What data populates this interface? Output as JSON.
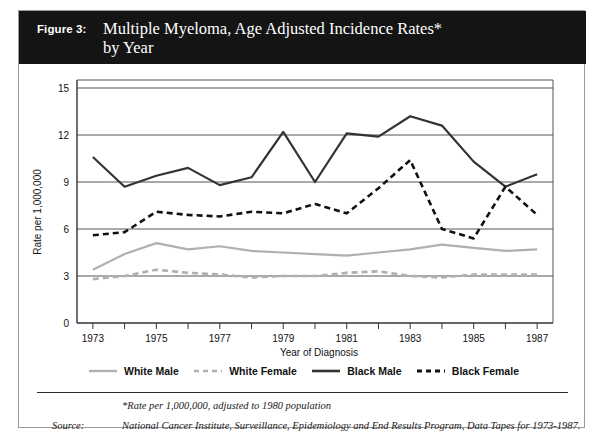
{
  "figure": {
    "label": "Figure 3:",
    "title": "Multiple Myeloma, Age Adjusted Incidence Rates*\nby Year"
  },
  "footnotes": {
    "star_note": "*Rate per 1,000,000, adjusted to 1980 population",
    "source_label": "Source:",
    "source_text": "National Cancer Institute, Surveillance, Epidemiology and End Results Program, Data Tapes for 1973-1987."
  },
  "legend": {
    "entries": [
      {
        "label": "White Male",
        "color": "#b0b0b0",
        "style": "solid"
      },
      {
        "label": "White Female",
        "color": "#b0b0b0",
        "style": "dashed"
      },
      {
        "label": "Black Male",
        "color": "#333333",
        "style": "solid"
      },
      {
        "label": "Black Female",
        "color": "#111111",
        "style": "dashed"
      }
    ]
  },
  "chart_data": {
    "type": "line",
    "title": "Multiple Myeloma, Age Adjusted Incidence Rates* by Year",
    "xlabel": "Year of Diagnosis",
    "ylabel": "Rate per 1,000,000",
    "xlim": [
      1972.5,
      1987.5
    ],
    "ylim": [
      0,
      15
    ],
    "yticks": [
      0,
      3,
      6,
      9,
      12,
      15
    ],
    "ytick_labels": [
      "0",
      "3",
      "6",
      "9",
      "12",
      "15"
    ],
    "xticks": [
      1973,
      1974,
      1975,
      1976,
      1977,
      1978,
      1979,
      1980,
      1981,
      1982,
      1983,
      1984,
      1985,
      1986,
      1987
    ],
    "xtick_labels_shown": [
      "1973",
      "1975",
      "1977",
      "1979",
      "1981",
      "1983",
      "1985",
      "1987"
    ],
    "grid": "horizontal",
    "legend_position": "below-plot",
    "x": [
      1973,
      1974,
      1975,
      1976,
      1977,
      1978,
      1979,
      1980,
      1981,
      1982,
      1983,
      1984,
      1985,
      1986,
      1987
    ],
    "series": [
      {
        "name": "White Male",
        "color": "#b0b0b0",
        "style": "solid",
        "values": [
          3.4,
          4.4,
          5.1,
          4.7,
          4.9,
          4.6,
          4.5,
          4.4,
          4.3,
          4.5,
          4.7,
          5.0,
          4.8,
          4.6,
          4.7
        ]
      },
      {
        "name": "White Female",
        "color": "#b0b0b0",
        "style": "dashed",
        "values": [
          2.8,
          3.0,
          3.4,
          3.2,
          3.1,
          2.9,
          3.0,
          3.0,
          3.2,
          3.3,
          3.0,
          2.9,
          3.1,
          3.1,
          3.1
        ]
      },
      {
        "name": "Black Male",
        "color": "#333333",
        "style": "solid",
        "values": [
          10.6,
          8.7,
          9.4,
          9.9,
          8.8,
          9.3,
          12.2,
          9.0,
          12.1,
          11.9,
          13.2,
          12.6,
          10.3,
          8.7,
          9.5
        ]
      },
      {
        "name": "Black Female",
        "color": "#111111",
        "style": "dashed",
        "values": [
          5.6,
          5.8,
          7.1,
          6.9,
          6.8,
          7.1,
          7.0,
          7.6,
          7.0,
          8.6,
          10.4,
          6.0,
          5.4,
          8.7,
          6.9
        ]
      }
    ]
  }
}
